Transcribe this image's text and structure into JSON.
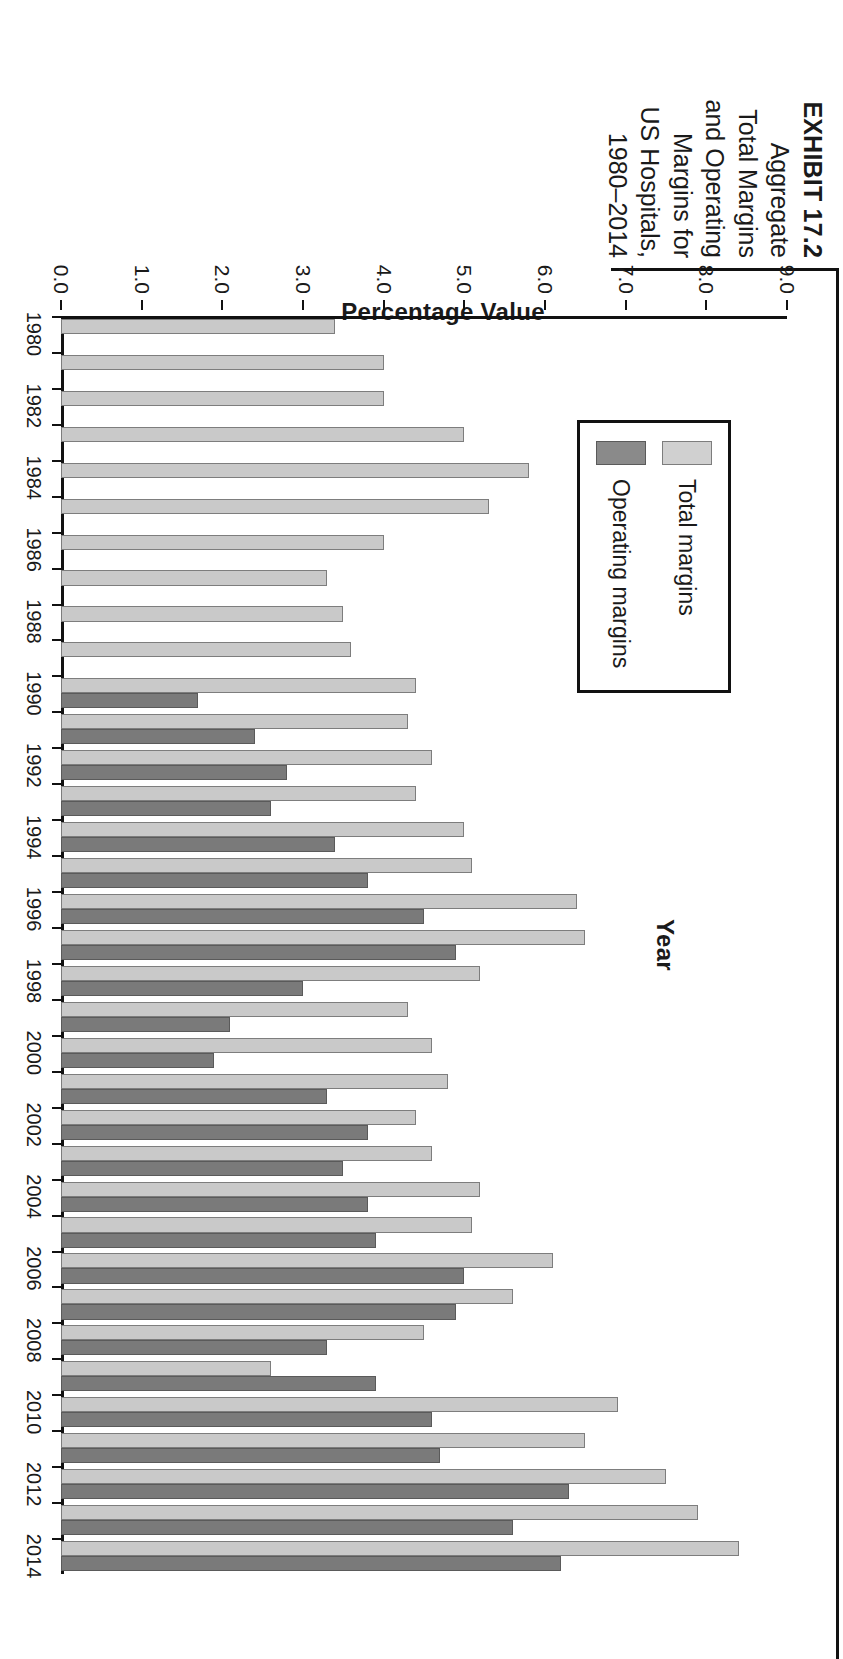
{
  "exhibit": {
    "title": "EXHIBIT 17.2",
    "caption_lines": [
      "Aggregate",
      "Total Margins",
      "and Operating",
      "Margins for",
      "US Hospitals,",
      "1980–2014"
    ]
  },
  "legend": {
    "position": "top-left-inside",
    "items": [
      {
        "label": "Total margins",
        "color": "#d0d0d0"
      },
      {
        "label": "Operating margins",
        "color": "#8a8a8a"
      }
    ]
  },
  "axes": {
    "y_title": "Percentage Value",
    "x_title": "Year",
    "y_ticks": [
      "0.0",
      "1.0",
      "2.0",
      "3.0",
      "4.0",
      "5.0",
      "6.0",
      "7.0",
      "8.0",
      "9.0"
    ],
    "x_ticks": [
      "1980",
      "1982",
      "1984",
      "1986",
      "1988",
      "1990",
      "1992",
      "1994",
      "1996",
      "1998",
      "2000",
      "2002",
      "2004",
      "2006",
      "2008",
      "2010",
      "2012",
      "2014"
    ]
  },
  "chart_data": {
    "type": "bar",
    "title": "Aggregate Total Margins and Operating Margins for US Hospitals, 1980–2014",
    "xlabel": "Year",
    "ylabel": "Percentage Value",
    "ylim": [
      0.0,
      9.0
    ],
    "grid": false,
    "legend_position": "upper left",
    "orientation": "vertical-columns",
    "categories": [
      "1980",
      "1981",
      "1982",
      "1983",
      "1984",
      "1985",
      "1986",
      "1987",
      "1988",
      "1989",
      "1990",
      "1991",
      "1992",
      "1993",
      "1994",
      "1995",
      "1996",
      "1997",
      "1998",
      "1999",
      "2000",
      "2001",
      "2002",
      "2003",
      "2004",
      "2005",
      "2006",
      "2007",
      "2008",
      "2009",
      "2010",
      "2011",
      "2012",
      "2013",
      "2014"
    ],
    "series": [
      {
        "name": "Total margins",
        "color": "#c9c9c9",
        "values": [
          3.4,
          4.0,
          4.0,
          5.0,
          5.8,
          5.3,
          4.0,
          3.3,
          3.5,
          3.6,
          4.4,
          4.3,
          4.6,
          4.4,
          5.0,
          5.1,
          6.4,
          6.5,
          5.2,
          4.3,
          4.6,
          4.8,
          4.4,
          4.6,
          5.2,
          5.1,
          6.1,
          5.6,
          4.5,
          2.6,
          6.9,
          6.5,
          7.5,
          7.9,
          8.4
        ]
      },
      {
        "name": "Operating margins",
        "color": "#7a7a7a",
        "values": [
          null,
          null,
          null,
          null,
          null,
          null,
          null,
          null,
          null,
          null,
          1.7,
          2.4,
          2.8,
          2.6,
          3.4,
          3.8,
          4.5,
          4.9,
          3.0,
          2.1,
          1.9,
          3.3,
          3.8,
          3.5,
          3.8,
          3.9,
          5.0,
          4.9,
          3.3,
          3.9,
          4.6,
          4.7,
          6.3,
          5.6,
          6.2
        ]
      }
    ]
  }
}
